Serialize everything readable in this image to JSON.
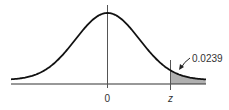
{
  "diagram": {
    "type": "standard-normal-curve",
    "axis_labels": {
      "mean": "0",
      "z": "z"
    },
    "shaded_area": {
      "label": "0.0239",
      "region": "right tail beyond z"
    },
    "colors": {
      "curve": "#111111",
      "shade": "#b0b0b0",
      "axis": "#333333"
    }
  }
}
